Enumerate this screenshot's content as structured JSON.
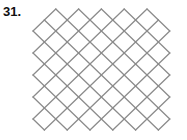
{
  "problem": {
    "number_label": "31."
  },
  "figure": {
    "type": "diamond-lattice",
    "origin_x": 33,
    "origin_y": 9,
    "step_x": 11.4,
    "step_y": 11,
    "i_max": 12,
    "j_max": 11,
    "excluded_corners": [
      [
        0,
        0
      ],
      [
        12,
        0
      ]
    ],
    "stroke_color": "#8c8c8c",
    "stroke_width": 1.3
  }
}
